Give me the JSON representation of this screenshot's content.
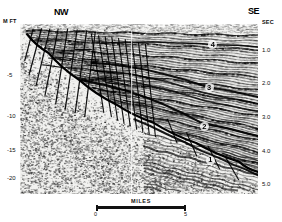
{
  "figure": {
    "type": "seismic-reflection-profile",
    "orientation_left": "NW",
    "orientation_right": "SE"
  },
  "axes": {
    "left": {
      "unit": "M FT",
      "ticks": [
        {
          "label": "-5",
          "y_frac": 0.3
        },
        {
          "label": "-10",
          "y_frac": 0.54
        },
        {
          "label": "-15",
          "y_frac": 0.74
        },
        {
          "label": "-20",
          "y_frac": 0.905
        }
      ]
    },
    "right": {
      "unit": "SEC",
      "ticks": [
        {
          "label": "1.0",
          "y_frac": 0.15
        },
        {
          "label": "2.0",
          "y_frac": 0.345
        },
        {
          "label": "3.0",
          "y_frac": 0.545
        },
        {
          "label": "4.0",
          "y_frac": 0.745
        },
        {
          "label": "5.0",
          "y_frac": 0.94
        }
      ]
    }
  },
  "horizons": [
    {
      "label": "4",
      "x_frac": 0.81,
      "y_frac": 0.12
    },
    {
      "label": "3",
      "x_frac": 0.795,
      "y_frac": 0.375
    },
    {
      "label": "2",
      "x_frac": 0.775,
      "y_frac": 0.605
    },
    {
      "label": "1",
      "x_frac": 0.8,
      "y_frac": 0.8
    }
  ],
  "scale": {
    "caption": "MILES",
    "start": "0",
    "end": "5"
  },
  "colors": {
    "ink": "#111111",
    "paper": "#ffffff",
    "panel": "#f4f4f2"
  },
  "chart_data": {
    "type": "line",
    "title": "",
    "xlabel": "MILES",
    "ylabel": "M FT",
    "ylabel_right": "SEC",
    "xlim": [
      0,
      5
    ],
    "ylim_left": [
      0,
      -22
    ],
    "ylim_right": [
      0.0,
      5.4
    ],
    "grid": false,
    "legend": "none",
    "annotations": [
      "NW",
      "SE",
      "MILES",
      "4",
      "3",
      "2",
      "1"
    ],
    "series": [
      {
        "name": "horizon-4",
        "points": [
          [
            0.34,
            0.115
          ],
          [
            0.5,
            0.108
          ],
          [
            0.66,
            0.112
          ],
          [
            0.82,
            0.122
          ],
          [
            1.0,
            0.135
          ]
        ]
      },
      {
        "name": "horizon-3",
        "points": [
          [
            0.3,
            0.23
          ],
          [
            0.46,
            0.252
          ],
          [
            0.62,
            0.3
          ],
          [
            0.78,
            0.368
          ],
          [
            1.0,
            0.43
          ]
        ]
      },
      {
        "name": "horizon-2",
        "points": [
          [
            0.26,
            0.33
          ],
          [
            0.44,
            0.39
          ],
          [
            0.6,
            0.47
          ],
          [
            0.76,
            0.58
          ],
          [
            1.0,
            0.66
          ]
        ]
      },
      {
        "name": "horizon-1",
        "points": [
          [
            0.48,
            0.56
          ],
          [
            0.62,
            0.65
          ],
          [
            0.76,
            0.745
          ],
          [
            0.9,
            0.83
          ],
          [
            1.0,
            0.89
          ]
        ]
      },
      {
        "name": "master-listric-fault",
        "points": [
          [
            0.03,
            0.06
          ],
          [
            0.12,
            0.17
          ],
          [
            0.25,
            0.33
          ],
          [
            0.4,
            0.47
          ],
          [
            0.56,
            0.58
          ],
          [
            0.74,
            0.7
          ],
          [
            0.92,
            0.81
          ],
          [
            1.0,
            0.87
          ]
        ]
      },
      {
        "name": "rollover-crest",
        "points": [
          [
            0.3,
            0.43
          ],
          [
            0.42,
            0.395
          ],
          [
            0.52,
            0.392
          ],
          [
            0.62,
            0.42
          ]
        ]
      }
    ]
  }
}
